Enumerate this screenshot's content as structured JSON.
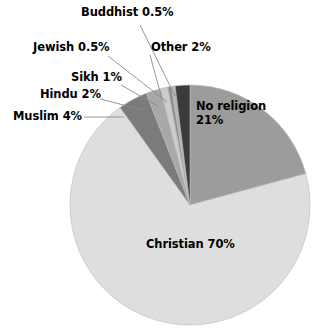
{
  "chart_data": {
    "type": "pie",
    "title": "",
    "subtitle": "",
    "xlabel": "",
    "ylabel": "",
    "legend_position": "none",
    "grid": false,
    "units": "percent",
    "total": 101,
    "start_angle_deg": 0,
    "direction": "clockwise",
    "categories": [
      "No religion",
      "Christian",
      "Muslim",
      "Hindu",
      "Sikh",
      "Jewish",
      "Buddhist",
      "Other"
    ],
    "values": [
      21,
      70,
      4,
      2,
      1,
      0.5,
      0.5,
      2
    ],
    "slices": [
      {
        "name": "no-religion",
        "label": "No religion",
        "value_text": "21%",
        "value": 21,
        "color": "#9c9c9c",
        "label_placement": "inside",
        "label_lines": [
          "No religion",
          "21%"
        ]
      },
      {
        "name": "christian",
        "label": "Christian",
        "value_text": "70%",
        "value": 70,
        "color": "#dedede",
        "label_placement": "inside",
        "label_lines": [
          "Christian 70%"
        ]
      },
      {
        "name": "muslim",
        "label": "Muslim",
        "value_text": "4%",
        "value": 4,
        "color": "#7b7b7b",
        "label_placement": "callout",
        "label_lines": [
          "Muslim 4%"
        ]
      },
      {
        "name": "hindu",
        "label": "Hindu",
        "value_text": "2%",
        "value": 2,
        "color": "#a8a8a8",
        "label_placement": "callout",
        "label_lines": [
          "Hindu 2%"
        ]
      },
      {
        "name": "sikh",
        "label": "Sikh",
        "value_text": "1%",
        "value": 1,
        "color": "#cccccc",
        "label_placement": "callout",
        "label_lines": [
          "Sikh 1%"
        ]
      },
      {
        "name": "jewish",
        "label": "Jewish",
        "value_text": "0.5%",
        "value": 0.5,
        "color": "#8e8e8e",
        "label_placement": "callout",
        "label_lines": [
          "Jewish 0.5%"
        ]
      },
      {
        "name": "buddhist",
        "label": "Buddhist",
        "value_text": "0.5%",
        "value": 0.5,
        "color": "#b5b5b5",
        "label_placement": "callout",
        "label_lines": [
          "Buddhist 0.5%"
        ]
      },
      {
        "name": "other",
        "label": "Other",
        "value_text": "2%",
        "value": 2,
        "color": "#3b3b3b",
        "label_placement": "callout",
        "label_lines": [
          "Other 2%"
        ]
      }
    ],
    "labels": {
      "buddhist": "Buddhist 0.5%",
      "jewish": "Jewish 0.5%",
      "sikh": "Sikh 1%",
      "hindu": "Hindu 2%",
      "muslim": "Muslim 4%",
      "other": "Other 2%",
      "no_religion_line1": "No religion",
      "no_religion_line2": "21%",
      "christian": "Christian 70%"
    },
    "colors": {
      "background": "#ffffff",
      "text": "#000000",
      "leader_line": "#8a8a8a",
      "slice_outline": "#b9b9b9"
    }
  }
}
